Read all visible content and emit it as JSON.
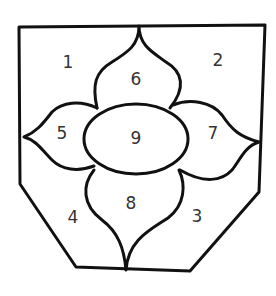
{
  "diagram": {
    "type": "numbered-region-outline",
    "stroke_color": "#111111",
    "label_color": "#333333",
    "regions": [
      {
        "id": 1,
        "label": "1",
        "description": "top-left corner region"
      },
      {
        "id": 2,
        "label": "2",
        "description": "top-right corner region"
      },
      {
        "id": 3,
        "label": "3",
        "description": "bottom-right region"
      },
      {
        "id": 4,
        "label": "4",
        "description": "bottom-left region"
      },
      {
        "id": 5,
        "label": "5",
        "description": "left petal"
      },
      {
        "id": 6,
        "label": "6",
        "description": "top petal"
      },
      {
        "id": 7,
        "label": "7",
        "description": "right petal"
      },
      {
        "id": 8,
        "label": "8",
        "description": "bottom petal"
      },
      {
        "id": 9,
        "label": "9",
        "description": "center oval"
      }
    ]
  }
}
